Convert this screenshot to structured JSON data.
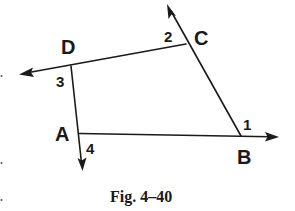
{
  "figure": {
    "caption": "Fig. 4–40",
    "vertices": [
      {
        "id": "D",
        "label": "D"
      },
      {
        "id": "C",
        "label": "C"
      },
      {
        "id": "A",
        "label": "A"
      },
      {
        "id": "B",
        "label": "B"
      }
    ],
    "angles": [
      {
        "id": "1",
        "label": "1",
        "at": "B"
      },
      {
        "id": "2",
        "label": "2",
        "at": "C"
      },
      {
        "id": "3",
        "label": "3",
        "at": "D"
      },
      {
        "id": "4",
        "label": "4",
        "at": "A"
      }
    ],
    "segments": [
      {
        "from": "D",
        "to": "C",
        "extended": "ray beyond D (left)"
      },
      {
        "from": "C",
        "to": "B",
        "extended": "ray beyond C (up)"
      },
      {
        "from": "A",
        "to": "B",
        "extended": "ray beyond B (right)"
      },
      {
        "from": "D",
        "to": "A",
        "extended": "ray beyond A (down)"
      }
    ],
    "colors": {
      "ink": "#1a1a1a",
      "background": "#ffffff"
    }
  }
}
